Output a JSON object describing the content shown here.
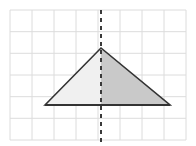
{
  "figure": {
    "background_color": "#ffffff",
    "width": 196,
    "height": 146
  },
  "grid": {
    "name": "coordinate-grid",
    "line_color": "#dcdcdc",
    "line_width": 1,
    "cell_width": 22,
    "cell_height": 21.7,
    "columns": 8,
    "rows": 6,
    "left": 10,
    "top": 10,
    "right": 186,
    "bottom": 140,
    "vertical_lines_x": [
      10,
      32,
      54,
      76,
      98,
      120,
      142,
      164,
      186
    ],
    "horizontal_lines_y": [
      10,
      31.7,
      53.3,
      75,
      96.7,
      118.3,
      140
    ]
  },
  "shape": {
    "name": "isosceles-triangle",
    "type": "triangle",
    "vertices": [
      {
        "label": "left-vertex",
        "x": 45,
        "y": 105
      },
      {
        "label": "apex",
        "x": 101,
        "y": 48
      },
      {
        "label": "right-vertex",
        "x": 170,
        "y": 105
      }
    ],
    "points_string": "45,105 101,48 170,105",
    "outline_color": "#333333",
    "outline_width": 1.6,
    "left_half_fill": "#f0f0f0",
    "right_half_fill": "#c9c9c9",
    "left_half_points": "45,105 101,48 101,105",
    "right_half_points": "101,48 170,105 101,105"
  },
  "symmetry_line": {
    "name": "line-of-symmetry",
    "orientation": "vertical",
    "x": 101,
    "y_start": 10,
    "y_end": 142,
    "color": "#3a3a3a",
    "width": 2,
    "dash_pattern": "4,4"
  },
  "base_line": {
    "name": "triangle-base",
    "x_start": 45,
    "x_end": 170,
    "y": 105,
    "color": "#333333",
    "width": 1.8
  }
}
